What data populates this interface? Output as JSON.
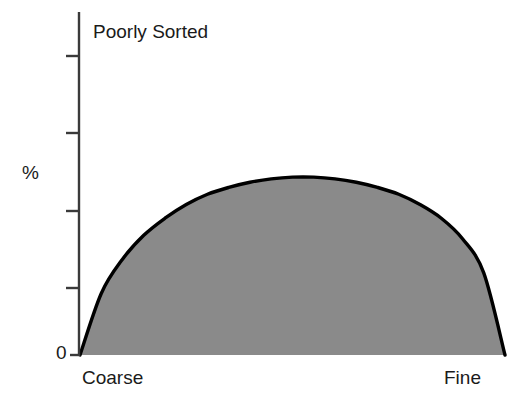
{
  "chart_data": {
    "type": "area",
    "title": "Poorly Sorted",
    "xlabel": "",
    "ylabel": "%",
    "x_tick_labels": [
      "Coarse",
      "Fine"
    ],
    "y_tick_labels": [
      "0",
      "",
      "",
      "",
      ""
    ],
    "y_zero_label": "0",
    "x_axis_left_label": "Coarse",
    "x_axis_right_label": "Fine",
    "grid": false,
    "legend": false,
    "y_tick_count": 5,
    "x": [
      0,
      5,
      10,
      15,
      20,
      25,
      30,
      35,
      40,
      45,
      50,
      55,
      60,
      65,
      70,
      75,
      80,
      85,
      90,
      95,
      100
    ],
    "values": [
      0,
      18,
      28,
      35,
      40,
      44,
      47,
      49,
      50.5,
      51.5,
      52,
      52,
      51.5,
      50.5,
      49,
      47,
      44,
      40,
      34,
      24,
      0
    ],
    "ylim": [
      0,
      100
    ],
    "xlim": [
      0,
      100
    ],
    "peak_value": 52,
    "peak_x": 52,
    "fill_color": "#8a8a8a",
    "line_color": "#000000",
    "axis_color": "#3a3a3a",
    "background_color": "#ffffff"
  },
  "axes": {
    "y_axis_name": "percent-axis",
    "x_axis_name": "grain-size-axis"
  }
}
